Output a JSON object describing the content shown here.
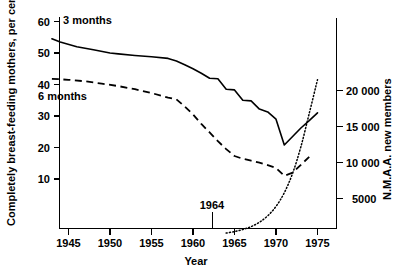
{
  "chart_data": {
    "type": "line",
    "title": "",
    "xlabel": "Year",
    "ylabel": "Completely breast-feeding mothers, per cent",
    "y2label": "N.M.A.A. new members",
    "xlim": [
      1942,
      1977
    ],
    "ylim": [
      0,
      62
    ],
    "y2lim": [
      0,
      24500
    ],
    "grid": false,
    "legend": "inline-labels",
    "xticks": [
      1945,
      1950,
      1955,
      1960,
      1965,
      1970,
      1975
    ],
    "xticklabels": [
      "1945",
      "1950",
      "1955",
      "1960",
      "1965",
      "1970",
      "1975"
    ],
    "yticks": [
      10,
      20,
      30,
      40,
      50,
      60
    ],
    "yticklabels": [
      "10",
      "20",
      "30",
      "40",
      "50",
      "60"
    ],
    "y2ticks": [
      5000,
      10000,
      15000,
      20000
    ],
    "y2ticklabels": [
      "5000",
      "10 000",
      "15 000",
      "20 000"
    ],
    "annotations": [
      {
        "text": "1964",
        "x": 1964,
        "y": 0,
        "label_dx": 0,
        "label_dy": 28
      }
    ],
    "series": [
      {
        "name": "3 months",
        "style": "solid",
        "axis": "left",
        "label_x": 1946.5,
        "label_y": 57.5,
        "x": [
          1943,
          1944,
          1946,
          1948,
          1950,
          1951,
          1953,
          1955,
          1957,
          1958,
          1959,
          1960,
          1961,
          1962,
          1963,
          1964,
          1965,
          1966,
          1967,
          1968,
          1969,
          1970,
          1971,
          1972,
          1973,
          1974,
          1975
        ],
        "values": [
          54.5,
          53.5,
          52.0,
          51.0,
          50.0,
          49.7,
          49.2,
          48.8,
          48.3,
          47.5,
          46.3,
          45.0,
          43.6,
          42.0,
          41.8,
          38.5,
          38.3,
          35.0,
          34.8,
          32.2,
          31.3,
          29.0,
          20.8,
          23.5,
          26.2,
          28.5,
          31.0
        ]
      },
      {
        "name": "6 months",
        "style": "dashed",
        "axis": "left",
        "label_x": 1945.2,
        "label_y": 38.0,
        "x": [
          1943,
          1945,
          1947,
          1949,
          1951,
          1953,
          1955,
          1957,
          1958,
          1959,
          1960,
          1961,
          1962,
          1963,
          1964,
          1965,
          1966,
          1967,
          1968,
          1969,
          1970,
          1971,
          1972,
          1973,
          1974
        ],
        "values": [
          41.8,
          41.5,
          41.0,
          40.3,
          39.5,
          38.5,
          37.3,
          35.8,
          35.3,
          33.0,
          30.5,
          27.5,
          24.8,
          22.0,
          19.5,
          17.3,
          16.4,
          15.8,
          15.2,
          14.4,
          13.5,
          11.0,
          12.0,
          14.5,
          17.0
        ]
      },
      {
        "name": "N.M.A.A. new members",
        "style": "dotted",
        "axis": "right",
        "x": [
          1964,
          1965,
          1966,
          1967,
          1968,
          1969,
          1970,
          1971,
          1972,
          1973,
          1974,
          1975
        ],
        "values": [
          200,
          400,
          700,
          1100,
          1700,
          2600,
          3900,
          5800,
          8500,
          12200,
          16800,
          21500
        ]
      }
    ]
  },
  "axes": {
    "left_title": "Completely breast-feeding mothers, per cent",
    "right_title": "N.M.A.A. new members",
    "bottom_title": "Year"
  },
  "labels": {
    "series_3_months": "3 months",
    "series_6_months": "6 months",
    "annotation_1964": "1964"
  },
  "colors": {
    "ink": "#000000",
    "background": "#ffffff"
  }
}
